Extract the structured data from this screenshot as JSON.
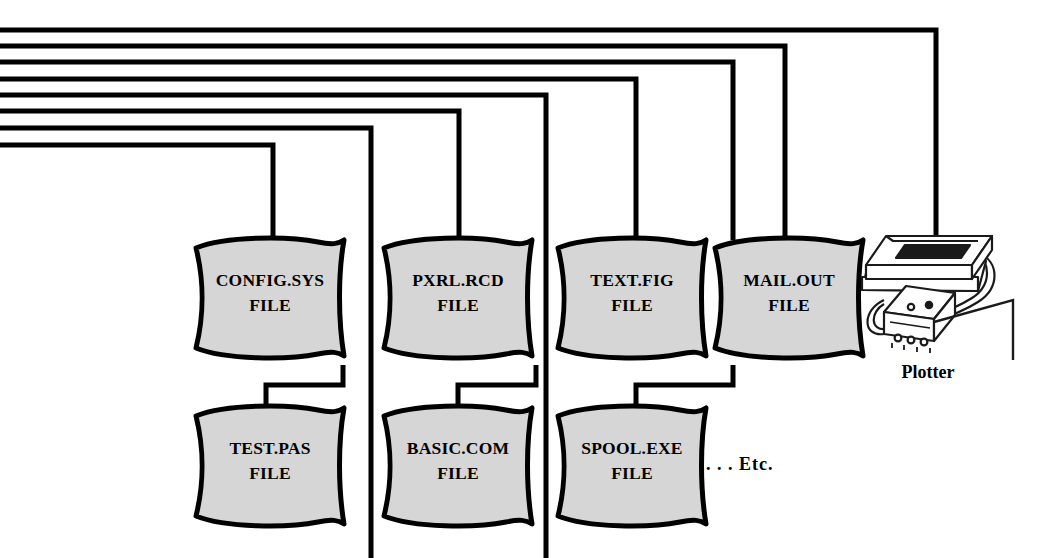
{
  "diagram": {
    "title_fragment": "",
    "colors": {
      "line": "#000000",
      "document_fill": "#d6d6d6",
      "document_stroke": "#000000",
      "background": "#ffffff",
      "plotter_stroke": "#1a1a1a"
    },
    "bus": {
      "description": "eight parallel horizontal bus lines entering from the left edge",
      "count": 8
    },
    "documents_row_top": [
      {
        "name": "CONFIG.SYS",
        "line2": "FILE"
      },
      {
        "name": "PXRL.RCD",
        "line2": "FILE"
      },
      {
        "name": "TEXT.FIG",
        "line2": "FILE"
      },
      {
        "name": "MAIL.OUT",
        "line2": "FILE"
      }
    ],
    "documents_row_bottom": [
      {
        "name": "TEST.PAS",
        "line2": "FILE"
      },
      {
        "name": "BASIC.COM",
        "line2": "FILE"
      },
      {
        "name": "SPOOL.EXE",
        "line2": "FILE"
      }
    ],
    "etc_label": ". . . Etc.",
    "plotter": {
      "label": "Plotter"
    }
  }
}
